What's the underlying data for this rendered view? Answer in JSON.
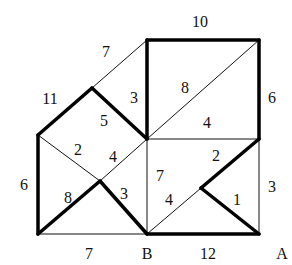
{
  "diagram": {
    "type": "weighted-graph",
    "colors": {
      "edge": "#111111",
      "background": "#ffffff"
    },
    "vertices": {
      "TL_sq": [
        147,
        40
      ],
      "TR_sq": [
        259,
        40
      ],
      "peak": [
        92,
        88
      ],
      "left": [
        38,
        135
      ],
      "center": [
        147,
        139
      ],
      "right_mid": [
        259,
        139
      ],
      "x_center": [
        100,
        181
      ],
      "inner_right": [
        201,
        188
      ],
      "bottom_left": [
        38,
        234
      ],
      "B": [
        147,
        234
      ],
      "A": [
        259,
        234
      ]
    },
    "edges": [
      {
        "from": "TL_sq",
        "to": "TR_sq",
        "weight": "10",
        "thick": true,
        "label_pos": [
          200,
          27
        ]
      },
      {
        "from": "TR_sq",
        "to": "right_mid",
        "weight": "6",
        "thick": true,
        "label_pos": [
          272,
          103
        ]
      },
      {
        "from": "TL_sq",
        "to": "center",
        "weight": "3",
        "thick": true,
        "label_pos": [
          134,
          103
        ]
      },
      {
        "from": "peak",
        "to": "TL_sq",
        "weight": "7",
        "thick": false,
        "label_pos": [
          106,
          57
        ]
      },
      {
        "from": "left",
        "to": "peak",
        "weight": "11",
        "thick": true,
        "label_pos": [
          50,
          104
        ]
      },
      {
        "from": "peak",
        "to": "center",
        "weight": "5",
        "thick": true,
        "label_pos": [
          104,
          126
        ]
      },
      {
        "from": "center",
        "to": "TR_sq",
        "weight": "8",
        "thick": false,
        "label_pos": [
          185,
          93
        ]
      },
      {
        "from": "center",
        "to": "right_mid",
        "weight": "4",
        "thick": false,
        "label_pos": [
          207,
          128
        ]
      },
      {
        "from": "left",
        "to": "x_center",
        "weight": "2",
        "thick": false,
        "label_pos": [
          78,
          155
        ]
      },
      {
        "from": "x_center",
        "to": "center",
        "weight": "4",
        "thick": false,
        "label_pos": [
          113,
          162
        ]
      },
      {
        "from": "left",
        "to": "bottom_left",
        "weight": "6",
        "thick": true,
        "label_pos": [
          24,
          190
        ]
      },
      {
        "from": "bottom_left",
        "to": "x_center",
        "weight": "8",
        "thick": true,
        "label_pos": [
          68,
          203
        ]
      },
      {
        "from": "x_center",
        "to": "B",
        "weight": "3",
        "thick": true,
        "label_pos": [
          124,
          199
        ]
      },
      {
        "from": "center",
        "to": "B",
        "weight": "7",
        "thick": false,
        "label_pos": [
          160,
          181
        ]
      },
      {
        "from": "right_mid",
        "to": "inner_right",
        "weight": "2",
        "thick": true,
        "label_pos": [
          216,
          161
        ]
      },
      {
        "from": "B",
        "to": "inner_right",
        "weight": "4",
        "thick": false,
        "label_pos": [
          169,
          205
        ]
      },
      {
        "from": "inner_right",
        "to": "A",
        "weight": "1",
        "thick": true,
        "label_pos": [
          237,
          205
        ]
      },
      {
        "from": "right_mid",
        "to": "A",
        "weight": "3",
        "thick": false,
        "label_pos": [
          272,
          192
        ]
      },
      {
        "from": "bottom_left",
        "to": "B",
        "weight": "7",
        "thick": false,
        "label_pos": [
          89,
          259
        ]
      },
      {
        "from": "B",
        "to": "A",
        "weight": "12",
        "thick": true,
        "label_pos": [
          208,
          259
        ]
      }
    ],
    "node_labels": [
      {
        "text": "B",
        "pos": [
          147,
          259
        ]
      },
      {
        "text": "A",
        "pos": [
          282,
          259
        ]
      }
    ]
  }
}
